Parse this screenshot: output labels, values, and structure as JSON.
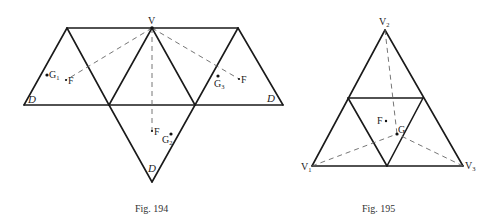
{
  "figures": [
    {
      "caption": "Fig. 194",
      "description": "Net of a regular tetrahedron-like unfolding: a trapezoid strip of three upward/downward triangles with a triangle hanging below, vertex V at top with dashed lines to centroids F of each face",
      "labels": {
        "apex": "V",
        "left_face_centroid": "F",
        "right_face_centroid": "F",
        "bottom_face_centroid": "F",
        "left_point": "G",
        "left_point_sub": "1",
        "right_point": "G",
        "right_point_sub": "3",
        "bottom_point": "G",
        "bottom_point_sub": "2",
        "corner_left": "D",
        "corner_right": "D",
        "corner_bottom": "D"
      }
    },
    {
      "caption": "Fig. 195",
      "description": "Equilateral triangle V1 V2 V3 subdivided into four triangles by midpoints; dashed lines from each vertex to point G; point F near center",
      "labels": {
        "top_vertex": "V",
        "top_vertex_sub": "2",
        "left_vertex": "V",
        "left_vertex_sub": "1",
        "right_vertex": "V",
        "right_vertex_sub": "3",
        "center_point_f": "F",
        "center_point_g": "G"
      }
    }
  ]
}
